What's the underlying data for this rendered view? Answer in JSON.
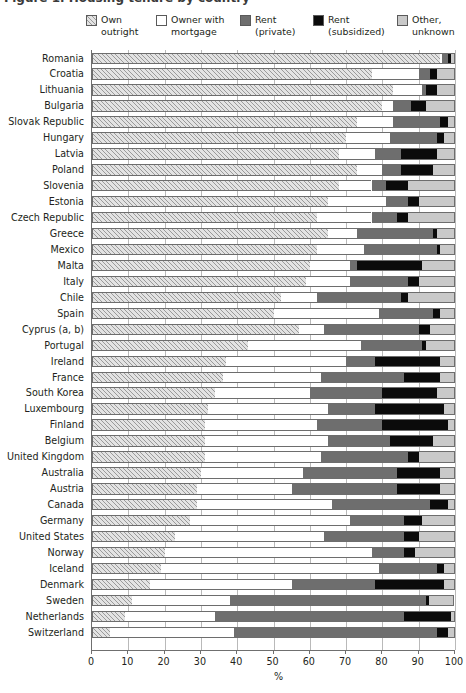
{
  "figure": {
    "clipped_title": "Figure 1. Housing tenure by country",
    "xaxis_title": "%",
    "xticks": [
      "0",
      "10",
      "20",
      "30",
      "40",
      "50",
      "60",
      "70",
      "80",
      "90",
      "100"
    ]
  },
  "legend": {
    "items": [
      {
        "label_line1": "Own",
        "label_line2": "outright",
        "key": "own_outright",
        "color": "#e3e3e3",
        "icon": "hatched-swatch-icon"
      },
      {
        "label_line1": "Owner with",
        "label_line2": "mortgage",
        "key": "owner_mortgage",
        "color": "#ffffff",
        "icon": "white-swatch-icon"
      },
      {
        "label_line1": "Rent",
        "label_line2": "(private)",
        "key": "rent_private",
        "color": "#6e6e6e",
        "icon": "dark-gray-swatch-icon"
      },
      {
        "label_line1": "Rent",
        "label_line2": "(subsidized)",
        "key": "rent_subsidized",
        "color": "#0b0b0b",
        "icon": "black-swatch-icon"
      },
      {
        "label_line1": "Other,",
        "label_line2": "unknown",
        "key": "other_unknown",
        "color": "#c9c9c9",
        "icon": "light-gray-swatch-icon"
      }
    ]
  },
  "chart_data": {
    "type": "bar",
    "orientation": "horizontal",
    "stacked": true,
    "normalized": true,
    "title": "Housing tenure by country",
    "xlabel": "%",
    "ylabel": "",
    "xlim": [
      0,
      100
    ],
    "grid": true,
    "legend_position": "top",
    "series": [
      {
        "name": "Own outright",
        "values": [
          96.0,
          77.0,
          83.0,
          80.0,
          73.0,
          70.0,
          68.0,
          73.0,
          68.0,
          65.0,
          62.0,
          65.0,
          62.0,
          60.0,
          59.0,
          52.0,
          50.0,
          57.0,
          43.0,
          37.0,
          36.0,
          34.0,
          32.0,
          31.0,
          31.0,
          31.0,
          30.0,
          29.0,
          29.0,
          27.0,
          23.0,
          20.0,
          19.0,
          16.0,
          11.0,
          9.0,
          8.0,
          5.0
        ]
      },
      {
        "name": "Owner with mortgage",
        "values": [
          0.5,
          19.0,
          7.0,
          3.0,
          10.0,
          14.0,
          10.0,
          9.0,
          9.0,
          16.0,
          15.0,
          8.0,
          13.0,
          12.0,
          13.0,
          26.0,
          29.0,
          7.0,
          31.0,
          33.0,
          27.0,
          26.0,
          33.0,
          31.0,
          34.0,
          32.0,
          28.0,
          26.0,
          37.0,
          44.0,
          41.0,
          57.0,
          60.0,
          39.0,
          27.0,
          25.0,
          51.0,
          34.0
        ]
      },
      {
        "name": "Rent (private)",
        "values": [
          1.5,
          2.0,
          1.0,
          5.0,
          13.0,
          12.0,
          8.0,
          6.0,
          4.0,
          6.0,
          6.0,
          21.0,
          20.0,
          3.0,
          16.0,
          16.0,
          18.0,
          26.0,
          17.0,
          8.0,
          23.0,
          20.0,
          13.0,
          18.0,
          17.0,
          24.0,
          26.0,
          29.0,
          27.0,
          15.0,
          22.0,
          9.0,
          16.0,
          23.0,
          54.0,
          52.0,
          37.0,
          56.0
        ]
      },
      {
        "name": "Rent (subsidized)",
        "values": [
          1.0,
          1.0,
          3.0,
          6.0,
          2.0,
          2.0,
          11.0,
          7.0,
          6.0,
          3.0,
          3.0,
          1.0,
          4.0,
          19.0,
          2.0,
          2.0,
          2.0,
          3.0,
          1.0,
          18.0,
          10.0,
          15.0,
          19.0,
          18.0,
          12.0,
          3.0,
          12.0,
          12.0,
          5.0,
          5.0,
          4.0,
          3.0,
          2.0,
          19.0,
          0.8,
          13.0,
          1.0,
          3.0
        ]
      },
      {
        "name": "Other, unknown",
        "values": [
          1.0,
          1.0,
          6.0,
          6.0,
          2.0,
          2.0,
          3.0,
          5.0,
          13.0,
          10.0,
          14.0,
          5.0,
          1.0,
          6.0,
          10.0,
          4.0,
          1.0,
          7.0,
          8.0,
          4.0,
          4.0,
          5.0,
          3.0,
          2.0,
          6.0,
          10.0,
          4.0,
          4.0,
          2.0,
          9.0,
          10.0,
          11.0,
          3.0,
          3.0,
          7.0,
          1.0,
          3.0,
          2.0
        ]
      }
    ],
    "categories": [
      "Romania",
      "Croatia",
      "Lithuania",
      "Bulgaria",
      "Slovak Republic",
      "Hungary",
      "Latvia",
      "Poland",
      "Slovenia",
      "Estonia",
      "Czech Republic",
      "Greece",
      "Mexico",
      "Malta",
      "Italy",
      "Chile",
      "Spain",
      "Cyprus (a, b)",
      "Portugal",
      "Ireland",
      "France",
      "South Korea",
      "Luxembourg",
      "Finland",
      "Belgium",
      "United Kingdom",
      "Australia",
      "Austria",
      "Canada",
      "Germany",
      "United States",
      "Norway",
      "Iceland",
      "Denmark",
      "Sweden",
      "Netherlands",
      "Switzerland",
      "Switzerland"
    ]
  },
  "rows": [
    {
      "label": "Romania",
      "segments": [
        96.0,
        0.5,
        1.5,
        1.0,
        1.0
      ]
    },
    {
      "label": "Croatia",
      "segments": [
        77.0,
        13.0,
        3.0,
        2.0,
        5.0
      ]
    },
    {
      "label": "Lithuania",
      "segments": [
        83.0,
        8.0,
        1.0,
        3.0,
        5.0
      ]
    },
    {
      "label": "Bulgaria",
      "segments": [
        80.0,
        3.0,
        5.0,
        4.0,
        8.0
      ]
    },
    {
      "label": "Slovak Republic",
      "segments": [
        73.0,
        10.0,
        13.0,
        2.0,
        2.0
      ]
    },
    {
      "label": "Hungary",
      "segments": [
        70.0,
        12.0,
        13.0,
        2.0,
        3.0
      ]
    },
    {
      "label": "Latvia",
      "segments": [
        68.0,
        10.0,
        7.0,
        10.0,
        5.0
      ]
    },
    {
      "label": "Poland",
      "segments": [
        73.0,
        7.0,
        5.0,
        9.0,
        6.0
      ]
    },
    {
      "label": "Slovenia",
      "segments": [
        68.0,
        9.0,
        4.0,
        6.0,
        13.0
      ]
    },
    {
      "label": "Estonia",
      "segments": [
        65.0,
        16.0,
        6.0,
        3.0,
        10.0
      ]
    },
    {
      "label": "Czech Republic",
      "segments": [
        62.0,
        15.0,
        7.0,
        3.0,
        13.0
      ]
    },
    {
      "label": "Greece",
      "segments": [
        65.0,
        8.0,
        21.0,
        1.0,
        5.0
      ]
    },
    {
      "label": "Mexico",
      "segments": [
        62.0,
        13.0,
        20.0,
        1.0,
        4.0
      ]
    },
    {
      "label": "Malta",
      "segments": [
        60.0,
        11.0,
        2.0,
        18.0,
        9.0
      ]
    },
    {
      "label": "Italy",
      "segments": [
        59.0,
        12.0,
        16.0,
        3.0,
        10.0
      ]
    },
    {
      "label": "Chile",
      "segments": [
        52.0,
        10.0,
        23.0,
        2.0,
        13.0
      ]
    },
    {
      "label": "Spain",
      "segments": [
        50.0,
        29.0,
        15.0,
        2.0,
        4.0
      ]
    },
    {
      "label": "Cyprus (a, b)",
      "segments": [
        57.0,
        7.0,
        26.0,
        3.0,
        7.0
      ]
    },
    {
      "label": "Portugal",
      "segments": [
        43.0,
        31.0,
        17.0,
        1.0,
        8.0
      ]
    },
    {
      "label": "Ireland",
      "segments": [
        37.0,
        33.0,
        8.0,
        18.0,
        4.0
      ]
    },
    {
      "label": "France",
      "segments": [
        36.0,
        27.0,
        23.0,
        10.0,
        4.0
      ]
    },
    {
      "label": "South Korea",
      "segments": [
        34.0,
        26.0,
        20.0,
        15.0,
        5.0
      ]
    },
    {
      "label": "Luxembourg",
      "segments": [
        32.0,
        33.0,
        13.0,
        19.0,
        3.0
      ]
    },
    {
      "label": "Finland",
      "segments": [
        31.0,
        31.0,
        18.0,
        18.0,
        2.0
      ]
    },
    {
      "label": "Belgium",
      "segments": [
        31.0,
        34.0,
        17.0,
        12.0,
        6.0
      ]
    },
    {
      "label": "United Kingdom",
      "segments": [
        31.0,
        32.0,
        24.0,
        3.0,
        10.0
      ]
    },
    {
      "label": "Australia",
      "segments": [
        30.0,
        28.0,
        26.0,
        12.0,
        4.0
      ]
    },
    {
      "label": "Austria",
      "segments": [
        29.0,
        26.0,
        29.0,
        12.0,
        4.0
      ]
    },
    {
      "label": "Canada",
      "segments": [
        29.0,
        37.0,
        27.0,
        5.0,
        2.0
      ]
    },
    {
      "label": "Germany",
      "segments": [
        27.0,
        44.0,
        15.0,
        5.0,
        9.0
      ]
    },
    {
      "label": "United States",
      "segments": [
        23.0,
        41.0,
        22.0,
        4.0,
        10.0
      ]
    },
    {
      "label": "Norway",
      "segments": [
        20.0,
        57.0,
        9.0,
        3.0,
        11.0
      ]
    },
    {
      "label": "Iceland",
      "segments": [
        19.0,
        60.0,
        16.0,
        2.0,
        3.0
      ]
    },
    {
      "label": "Denmark",
      "segments": [
        16.0,
        39.0,
        23.0,
        19.0,
        3.0
      ]
    },
    {
      "label": "Sweden",
      "segments": [
        11.0,
        27.0,
        54.0,
        0.8,
        7.0
      ]
    },
    {
      "label": "Netherlands",
      "segments": [
        9.0,
        25.0,
        52.0,
        13.0,
        1.0
      ]
    },
    {
      "label": "Switzerland",
      "segments": [
        5.0,
        34.0,
        56.0,
        3.0,
        2.0
      ]
    }
  ]
}
